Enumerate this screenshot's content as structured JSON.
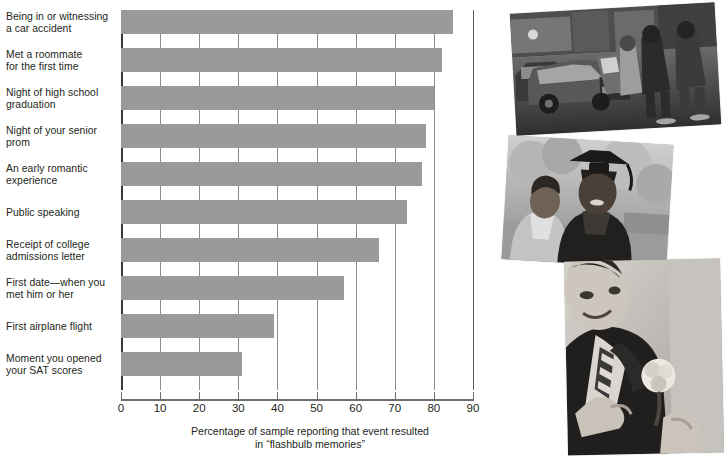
{
  "chart_data": {
    "type": "bar",
    "orientation": "horizontal",
    "title": "",
    "subtitle": "",
    "xlabel": "Percentage of sample reporting that event resulted in \"flashbulb memories\"",
    "ylabel": "",
    "xlim": [
      0,
      90
    ],
    "xticks": [
      0,
      10,
      20,
      30,
      40,
      50,
      60,
      70,
      80,
      90
    ],
    "xtick_labels": [
      "0",
      "10",
      "20",
      "30",
      "40",
      "50",
      "60",
      "70",
      "80",
      "90"
    ],
    "grid": true,
    "grid_axis": "x",
    "legend": false,
    "bar_color": "#9a9a9a",
    "categories": [
      "Being in or witnessing a car accident",
      "Met a roommate for the first time",
      "Night of high school graduation",
      "Night of your senior prom",
      "An early romantic experience",
      "Public speaking",
      "Receipt of college admissions letter",
      "First date—when you met him or her",
      "First airplane flight",
      "Moment you opened your SAT scores"
    ],
    "values": [
      85,
      82,
      80,
      78,
      77,
      73,
      66,
      57,
      39,
      31
    ]
  },
  "chart": {
    "caption_line_1": "Percentage of sample reporting that event resulted",
    "caption_line_2": "in “flashbulb memories”",
    "categories": [
      {
        "line1": "Being in or witnessing",
        "line2": "a car accident"
      },
      {
        "line1": "Met a roommate",
        "line2": "for the first time"
      },
      {
        "line1": "Night of high school",
        "line2": "graduation"
      },
      {
        "line1": "Night of your senior",
        "line2": "prom"
      },
      {
        "line1": "An early romantic",
        "line2": "experience"
      },
      {
        "line1": "Public speaking",
        "line2": ""
      },
      {
        "line1": "Receipt of college",
        "line2": "admissions letter"
      },
      {
        "line1": "First date—when you",
        "line2": "met him or her"
      },
      {
        "line1": "First airplane flight",
        "line2": ""
      },
      {
        "line1": "Moment you opened",
        "line2": "your SAT scores"
      }
    ]
  },
  "photos": [
    {
      "name": "car-accident-photo",
      "alt": "Car accident scene with damaged car and bystanders on a street"
    },
    {
      "name": "graduation-photo",
      "alt": "Graduate in cap and gown with a smiling woman"
    },
    {
      "name": "prom-photo",
      "alt": "Young man in suit having a boutonniere pinned on"
    }
  ],
  "colors": {
    "bar": "#9a9a9a",
    "grid": "#8d8d8d",
    "axis": "#3b3b3b",
    "text": "#231f20"
  }
}
